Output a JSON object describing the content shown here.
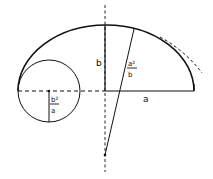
{
  "diagram": {
    "title": "",
    "colors": {
      "stroke": "#111111",
      "background": "#ffffff"
    },
    "labels": {
      "semi_minor": "b",
      "semi_major": "a",
      "radius_top_num": "a²",
      "radius_top_den": "b",
      "radius_side_num": "b²",
      "radius_side_den": "a"
    },
    "shapes": {
      "half_ellipse": {
        "center": [
          105,
          91
        ],
        "rx": 88,
        "ry": 66
      },
      "vertex_circle": {
        "center": [
          49,
          91
        ],
        "r": 31
      },
      "osculating_arc_center": [
        105,
        155
      ],
      "osculating_arc_radius": 130
    }
  }
}
